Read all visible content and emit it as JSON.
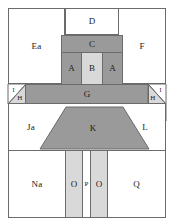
{
  "figure": {
    "type": "schematic-cross-section",
    "title": "",
    "background_color": "#ffffff",
    "line_color": "#6b6b6b",
    "fills": {
      "white": "#ffffff",
      "light_gray": "#d9d9d9",
      "medium_gray": "#9a9a9a"
    }
  },
  "regions": [
    {
      "id": "Ea",
      "label": "Ea",
      "fill": "white"
    },
    {
      "id": "D",
      "label": "D",
      "fill": "white"
    },
    {
      "id": "F",
      "label": "F",
      "fill": "white"
    },
    {
      "id": "C",
      "label": "C",
      "fill": "medium_gray"
    },
    {
      "id": "A1",
      "label": "A",
      "fill": "medium_gray"
    },
    {
      "id": "B",
      "label": "B",
      "fill": "light_gray"
    },
    {
      "id": "A2",
      "label": "A",
      "fill": "medium_gray"
    },
    {
      "id": "I1",
      "label": "I",
      "fill": "white"
    },
    {
      "id": "H1",
      "label": "H",
      "fill": "light_gray"
    },
    {
      "id": "G",
      "label": "G",
      "fill": "medium_gray"
    },
    {
      "id": "I2",
      "label": "I",
      "fill": "white"
    },
    {
      "id": "H2",
      "label": "H",
      "fill": "light_gray"
    },
    {
      "id": "M",
      "label": "M",
      "fill": "white"
    },
    {
      "id": "Ja",
      "label": "Ja",
      "fill": "white"
    },
    {
      "id": "K",
      "label": "K",
      "fill": "medium_gray"
    },
    {
      "id": "L",
      "label": "L",
      "fill": "white"
    },
    {
      "id": "Na",
      "label": "Na",
      "fill": "white"
    },
    {
      "id": "O1",
      "label": "O",
      "fill": "light_gray"
    },
    {
      "id": "P",
      "label": "P",
      "fill": "white"
    },
    {
      "id": "O2",
      "label": "O",
      "fill": "light_gray"
    },
    {
      "id": "Q",
      "label": "Q",
      "fill": "white"
    }
  ],
  "labels": {
    "Ea": "Ea",
    "D": "D",
    "F": "F",
    "C": "C",
    "A_left": "A",
    "B": "B",
    "A_right": "A",
    "I_left": "I",
    "H_left": "H",
    "G": "G",
    "I_right": "I",
    "H_right": "H",
    "M": "M",
    "Ja": "Ja",
    "K": "K",
    "L": "L",
    "Na": "Na",
    "O_left": "O",
    "P": "P",
    "O_right": "O",
    "Q": "Q"
  }
}
